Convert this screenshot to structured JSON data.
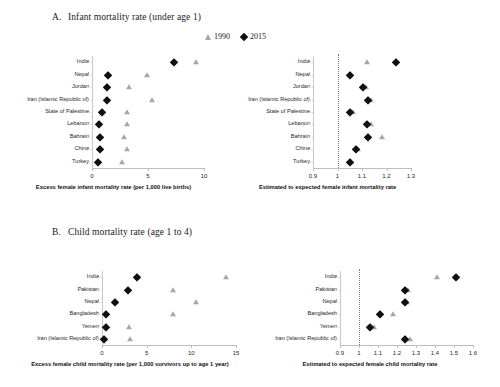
{
  "legend": {
    "items": [
      {
        "label": "1990",
        "marker": "triangle-up-icon",
        "color": "#a6a6a6"
      },
      {
        "label": "2015",
        "marker": "diamond-icon",
        "color": "#101010"
      }
    ]
  },
  "panels": [
    {
      "letter": "A.",
      "title": "Infant mortality rate (under age 1)"
    },
    {
      "letter": "B.",
      "title": "Child mortality rate (age 1 to 4)"
    }
  ],
  "chart_data": [
    {
      "id": "panel-a-left",
      "type": "scatter",
      "title": "",
      "xlabel": "Excess female infant mortality rate (per 1,000 live births)",
      "ylabel": "",
      "xlim": [
        0,
        10
      ],
      "xticks": [
        0,
        5,
        10
      ],
      "xticklabels": [
        "0",
        "5",
        "10"
      ],
      "grid": false,
      "legend_position": "top-center",
      "categories": [
        "India",
        "Nepal",
        "Jordan",
        "Iran (Islamic Republic of)",
        "State of Palestine",
        "Lebanon",
        "Bahrain",
        "China",
        "Turkey"
      ],
      "series": [
        {
          "name": "1990",
          "marker": "triangle-up-icon",
          "color": "#a6a6a6",
          "values": [
            9.3,
            4.9,
            3.3,
            5.4,
            3.1,
            3.1,
            2.9,
            3.1,
            2.7
          ]
        },
        {
          "name": "2015",
          "marker": "diamond-icon",
          "color": "#101010",
          "values": [
            7.3,
            1.4,
            1.3,
            1.3,
            0.9,
            0.6,
            0.7,
            0.7,
            0.5
          ]
        }
      ]
    },
    {
      "id": "panel-a-right",
      "type": "scatter",
      "title": "",
      "xlabel": "Estimated to expected female infant mortality rate",
      "ylabel": "",
      "xlim": [
        0.9,
        1.3
      ],
      "xticks": [
        0.9,
        1.0,
        1.1,
        1.2,
        1.3
      ],
      "xticklabels": [
        "0.9",
        "1",
        "1.1",
        "1.2",
        "1.3"
      ],
      "reference_line": 1.0,
      "grid": false,
      "categories": [
        "India",
        "Nepal",
        "Jordan",
        "Iran (Islamic Republic of)",
        "State of Palestine",
        "Lebanon",
        "Bahrain",
        "China",
        "Turkey"
      ],
      "series": [
        {
          "name": "1990",
          "marker": "triangle-up-icon",
          "color": "#a6a6a6",
          "values": [
            1.12,
            1.05,
            1.115,
            1.135,
            1.065,
            1.135,
            1.18,
            1.085,
            1.055
          ]
        },
        {
          "name": "2015",
          "marker": "diamond-icon",
          "color": "#101010",
          "values": [
            1.24,
            1.05,
            1.105,
            1.125,
            1.05,
            1.12,
            1.125,
            1.075,
            1.05
          ]
        }
      ]
    },
    {
      "id": "panel-b-left",
      "type": "scatter",
      "title": "",
      "xlabel": "Excess female child mortality rate (per 1,000 survivors up to age 1 year)",
      "ylabel": "",
      "xlim": [
        0,
        15
      ],
      "xticks": [
        0,
        5,
        10,
        15
      ],
      "xticklabels": [
        "0",
        "5",
        "10",
        "15"
      ],
      "grid": false,
      "categories": [
        "India",
        "Pakistan",
        "Nepal",
        "Bangladesh",
        "Yemen",
        "Iran (Islamic Republic of)"
      ],
      "series": [
        {
          "name": "1990",
          "marker": "triangle-up-icon",
          "color": "#a6a6a6",
          "values": [
            13.9,
            8.0,
            10.5,
            8.0,
            3.0,
            3.1
          ]
        },
        {
          "name": "2015",
          "marker": "diamond-icon",
          "color": "#101010",
          "values": [
            3.9,
            2.9,
            1.4,
            0.5,
            0.4,
            0.2
          ]
        }
      ]
    },
    {
      "id": "panel-b-right",
      "type": "scatter",
      "title": "",
      "xlabel": "Estimated to expected female child mortality rate",
      "ylabel": "",
      "xlim": [
        0.9,
        1.6
      ],
      "xticks": [
        0.9,
        1.0,
        1.1,
        1.2,
        1.3,
        1.4,
        1.5,
        1.6
      ],
      "xticklabels": [
        "0.9",
        "1",
        "1.1",
        "1.2",
        "1.3",
        "1.4",
        "1.5",
        "1.6"
      ],
      "reference_line": 1.0,
      "grid": false,
      "categories": [
        "India",
        "Pakistan",
        "Nepal",
        "Bangladesh",
        "Yemen",
        "Iran (Islamic Republic of)"
      ],
      "series": [
        {
          "name": "1990",
          "marker": "triangle-up-icon",
          "color": "#a6a6a6",
          "values": [
            1.41,
            1.26,
            1.25,
            1.18,
            1.08,
            1.27
          ]
        },
        {
          "name": "2015",
          "marker": "diamond-icon",
          "color": "#101010",
          "values": [
            1.51,
            1.24,
            1.24,
            1.11,
            1.06,
            1.24
          ]
        }
      ]
    }
  ],
  "layout": {
    "charts": [
      {
        "id": "panel-a-left",
        "left": 92,
        "top": 56,
        "width": 112,
        "height": 112,
        "label_width": 66
      },
      {
        "id": "panel-a-right",
        "left": 313,
        "top": 56,
        "width": 98,
        "height": 112,
        "label_width": 66
      },
      {
        "id": "panel-b-left",
        "left": 102,
        "top": 271,
        "width": 134,
        "height": 74,
        "label_width": 70
      },
      {
        "id": "panel-b-right",
        "left": 340,
        "top": 271,
        "width": 133,
        "height": 74,
        "label_width": 70
      }
    ]
  }
}
